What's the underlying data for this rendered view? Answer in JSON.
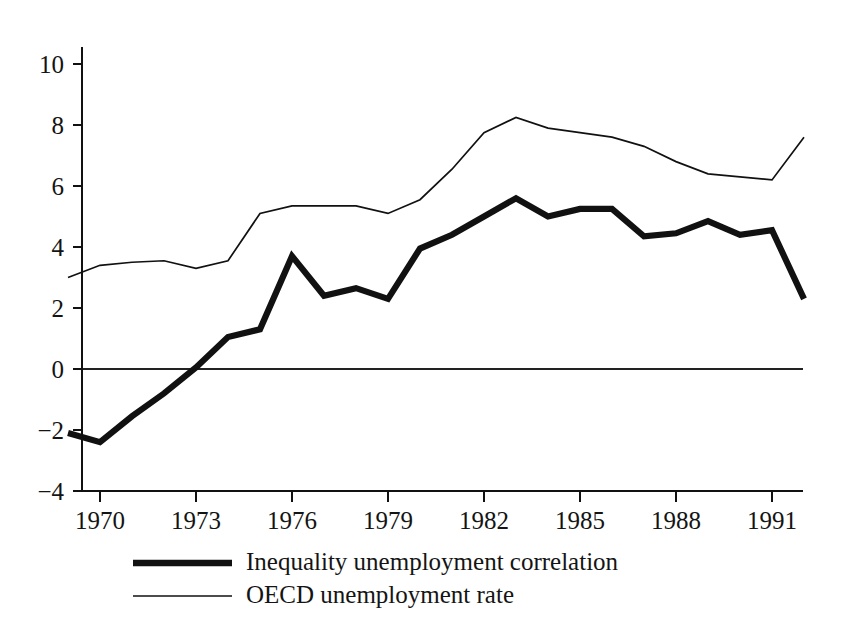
{
  "chart_data": {
    "type": "line",
    "title": "",
    "subtitle": "",
    "xlabel": "",
    "ylabel": "",
    "xlim": [
      1969,
      1992
    ],
    "ylim": [
      -4,
      10
    ],
    "yticks": [
      -4,
      -2,
      0,
      2,
      4,
      6,
      8,
      10
    ],
    "ytick_labels": [
      "−4",
      "−2",
      "0",
      "2",
      "4",
      "6",
      "8",
      "10"
    ],
    "xticks": [
      1970,
      1973,
      1976,
      1979,
      1982,
      1985,
      1988,
      1991
    ],
    "xtick_labels": [
      "1970",
      "1973",
      "1976",
      "1979",
      "1982",
      "1985",
      "1988",
      "1991"
    ],
    "grid": false,
    "zero_reference_line": 0,
    "legend_position": "below-axes",
    "x": [
      1969,
      1970,
      1971,
      1972,
      1973,
      1974,
      1975,
      1976,
      1977,
      1978,
      1979,
      1980,
      1981,
      1982,
      1983,
      1984,
      1985,
      1986,
      1987,
      1988,
      1989,
      1990,
      1991,
      1992
    ],
    "series": [
      {
        "name": "Inequality unemployment correlation",
        "style": "thick",
        "color": "#111111",
        "values": [
          -2.1,
          -2.4,
          -1.55,
          -0.8,
          0.05,
          1.05,
          1.3,
          3.7,
          2.4,
          2.65,
          2.3,
          3.95,
          4.4,
          5.0,
          5.6,
          5.0,
          5.25,
          5.25,
          4.35,
          4.45,
          4.85,
          4.4,
          4.55,
          2.3
        ]
      },
      {
        "name": "OECD unemployment rate",
        "style": "thin",
        "color": "#111111",
        "values": [
          3.0,
          3.4,
          3.5,
          3.55,
          3.3,
          3.55,
          5.1,
          5.35,
          5.35,
          5.35,
          5.1,
          5.55,
          6.55,
          7.75,
          8.25,
          7.9,
          7.75,
          7.6,
          7.3,
          6.8,
          6.4,
          6.3,
          6.2,
          7.6
        ]
      }
    ],
    "legend": [
      {
        "label": "Inequality unemployment correlation",
        "style": "thick"
      },
      {
        "label": "OECD unemployment rate",
        "style": "thin"
      }
    ]
  }
}
